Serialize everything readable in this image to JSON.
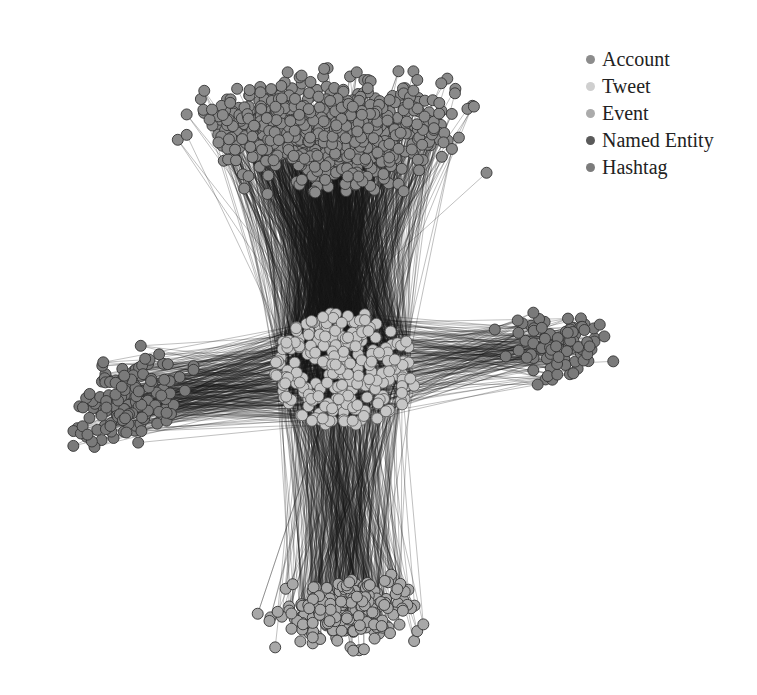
{
  "legend": [
    {
      "label": "Account",
      "color": "#8c8c8c"
    },
    {
      "label": "Tweet",
      "color": "#cfcfcf"
    },
    {
      "label": "Event",
      "color": "#ababab"
    },
    {
      "label": "Named Entity",
      "color": "#5a5a5a"
    },
    {
      "label": "Hashtag",
      "color": "#7c7c7c"
    }
  ],
  "graph": {
    "hub": {
      "type": "Tweet",
      "cx": 345,
      "cy": 370,
      "rx": 72,
      "ry": 58,
      "count": 260,
      "color": "#c6c6c6"
    },
    "clusters": [
      {
        "type": "Account",
        "color": "#8a8a8a",
        "count": 700,
        "region": "top",
        "cx": 330,
        "cy": 130,
        "rx": 170,
        "ry": 80
      },
      {
        "type": "Event",
        "color": "#a8a8a8",
        "count": 220,
        "region": "bottom",
        "cx": 345,
        "cy": 610,
        "rx": 95,
        "ry": 50
      },
      {
        "type": "Named Entity",
        "color": "#7a7a7a",
        "count": 150,
        "region": "left",
        "cx": 130,
        "cy": 400,
        "rx": 80,
        "ry": 60
      },
      {
        "type": "Hashtag",
        "color": "#7a7a7a",
        "count": 90,
        "region": "right",
        "cx": 560,
        "cy": 345,
        "rx": 70,
        "ry": 45
      }
    ],
    "edge_color": "#1a1a1a",
    "node_radius": 5.5
  }
}
